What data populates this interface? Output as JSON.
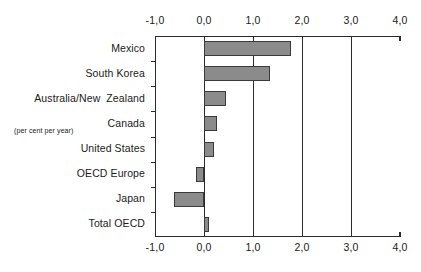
{
  "chart_data": {
    "type": "bar",
    "orientation": "horizontal",
    "title": "",
    "subtitle": "",
    "xlabel": "",
    "ylabel": "",
    "units_note": "(per cent per year)",
    "categories": [
      "Mexico",
      "South Korea",
      "Australia/New  Zealand",
      "Canada",
      "United States",
      "OECD Europe",
      "Japan",
      "Total OECD"
    ],
    "values": [
      1.78,
      1.35,
      0.45,
      0.27,
      0.2,
      -0.17,
      -0.62,
      0.1
    ],
    "series": [
      {
        "name": "",
        "values": [
          1.78,
          1.35,
          0.45,
          0.27,
          0.2,
          -0.17,
          -0.62,
          0.1
        ]
      }
    ],
    "xlim": [
      -1.0,
      4.0
    ],
    "xticks": [
      -1.0,
      0.0,
      1.0,
      2.0,
      3.0,
      4.0
    ],
    "xticklabels": [
      "-1,0",
      "0,0",
      "1,0",
      "2,0",
      "3,0",
      "4,0"
    ],
    "xticklabels_top": [
      "-1,0",
      "0,0",
      "1,0",
      "2,0",
      "3,0",
      "4,0"
    ],
    "xticklabels_bottom": [
      "-1,0",
      "0,0",
      "1,0",
      "2,0",
      "3,0",
      "4,0"
    ],
    "gridlines_x": [
      0.0,
      1.0,
      2.0,
      3.0
    ],
    "grid": true,
    "legend": null,
    "legend_position": "none",
    "decimal_separator": ",",
    "axis_duplicated_top_and_bottom": true
  },
  "style": {
    "bar_fill": "#8b8b8b",
    "bar_border": "#3a3a3a",
    "axis_color": "#2b2b2b",
    "text_color": "#1a1a1a",
    "background": "#ffffff"
  }
}
